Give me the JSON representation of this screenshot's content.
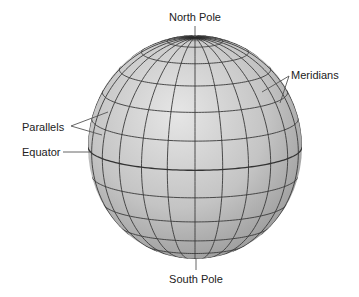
{
  "diagram": {
    "labels": {
      "north_pole": "North Pole",
      "south_pole": "South Pole",
      "meridians": "Meridians",
      "parallels": "Parallels",
      "equator": "Equator"
    },
    "grid": {
      "meridian_step_deg": 15,
      "parallel_step_deg": 15,
      "tilt_deg": 12
    },
    "colors": {
      "globe_light": "#e4e4e4",
      "globe_mid": "#bcbcbc",
      "globe_dark": "#8a8a8a",
      "grid_line": "#3a3a3a",
      "label_text": "#222222"
    }
  }
}
